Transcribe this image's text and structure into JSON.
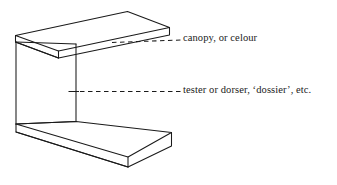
{
  "figure": {
    "type": "line-diagram",
    "background_color": "#ffffff",
    "stroke_color": "#1a1a1a",
    "labels": [
      {
        "id": "canopy",
        "text": "canopy, or celour",
        "points_to": "overhead-canopy-panel",
        "leader": "dashed"
      },
      {
        "id": "tester",
        "text": "tester or dorser, ‘dossier’, etc.",
        "points_to": "vertical-hanging-panel",
        "leader": "dashed"
      }
    ],
    "parts": [
      "canopy-panel",
      "tester-panel",
      "bed-base",
      "canopy-leader-line",
      "tester-leader-line"
    ]
  }
}
